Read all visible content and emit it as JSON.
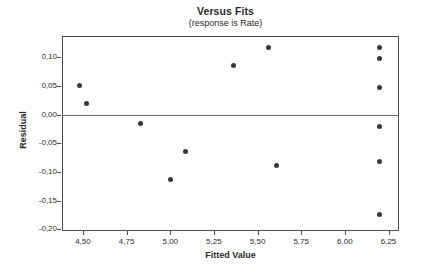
{
  "chart_data": {
    "type": "scatter",
    "title": "Versus Fits",
    "subtitle": "(response is Rate)",
    "xlabel": "Fitted Value",
    "ylabel": "Residual",
    "xlim": [
      4.38,
      6.31
    ],
    "ylim": [
      -0.203,
      0.137
    ],
    "grid": false,
    "legend": "none",
    "reference_line_y": 0,
    "x_ticks": [
      {
        "value": 4.5,
        "label": "4,50"
      },
      {
        "value": 4.75,
        "label": "4,75"
      },
      {
        "value": 5.0,
        "label": "5,00"
      },
      {
        "value": 5.25,
        "label": "5,25"
      },
      {
        "value": 5.5,
        "label": "5,50"
      },
      {
        "value": 5.75,
        "label": "5,75"
      },
      {
        "value": 6.0,
        "label": "6,00"
      },
      {
        "value": 6.25,
        "label": "6,25"
      }
    ],
    "y_ticks": [
      {
        "value": 0.1,
        "label": "0,10"
      },
      {
        "value": 0.05,
        "label": "0,05"
      },
      {
        "value": 0.0,
        "label": "0,00"
      },
      {
        "value": -0.05,
        "label": "-0,05"
      },
      {
        "value": -0.1,
        "label": "-0,10"
      },
      {
        "value": -0.15,
        "label": "-0,15"
      },
      {
        "value": -0.2,
        "label": "-0,20"
      }
    ],
    "points": [
      [
        4.48,
        0.051
      ],
      [
        4.52,
        0.019
      ],
      [
        4.83,
        -0.015
      ],
      [
        5.0,
        -0.113
      ],
      [
        5.09,
        -0.065
      ],
      [
        5.36,
        0.085
      ],
      [
        5.56,
        0.117
      ],
      [
        5.61,
        -0.088
      ],
      [
        6.2,
        0.117
      ],
      [
        6.2,
        0.098
      ],
      [
        6.2,
        0.048
      ],
      [
        6.2,
        -0.021
      ],
      [
        6.2,
        -0.082
      ],
      [
        6.2,
        -0.175
      ]
    ],
    "colors": {
      "point": "#383838",
      "frame": "#4f4f4f",
      "reference_line": "#707070",
      "text": "#2b2b2b",
      "background": "#ffffff"
    }
  }
}
